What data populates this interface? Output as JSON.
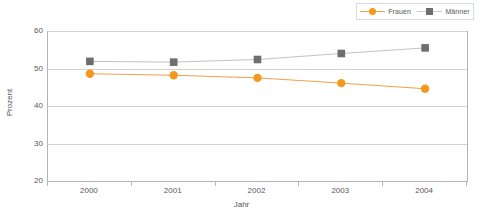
{
  "chart_data": {
    "type": "line",
    "title": "",
    "subtitle": "",
    "xlabel": "Jahr",
    "ylabel": "Prozent",
    "categories": [
      "2000",
      "2001",
      "2002",
      "2003",
      "2004"
    ],
    "x": [
      2000,
      2001,
      2002,
      2003,
      2004
    ],
    "xlim": [
      1999.5,
      2004.5
    ],
    "ylim": [
      20,
      60
    ],
    "y_ticks": [
      20,
      30,
      40,
      50,
      60
    ],
    "grid": "horizontal",
    "legend_position": "top-right",
    "series": [
      {
        "name": "Frauen",
        "color": "#f5981e",
        "line_color": "#f0a04a",
        "marker": "circle",
        "values": [
          48.6,
          48.2,
          47.5,
          46.1,
          44.6
        ]
      },
      {
        "name": "Männer",
        "color": "#6e6e6e",
        "line_color": "#c3c3c3",
        "marker": "square",
        "values": [
          51.9,
          51.7,
          52.4,
          54.0,
          55.5
        ]
      }
    ]
  },
  "legend": {
    "entries": [
      {
        "label": "Frauen"
      },
      {
        "label": "Männer"
      }
    ]
  },
  "axes": {
    "y_title": "Prozent",
    "x_title": "Jahr",
    "y_tick_labels": [
      "60",
      "50",
      "40",
      "30",
      "20"
    ],
    "x_tick_labels": [
      "2000",
      "2001",
      "2002",
      "2003",
      "2004"
    ]
  },
  "colors": {
    "frauen": "#f5981e",
    "frauen_line": "#f0a04a",
    "maenner": "#6e6e6e",
    "maenner_line": "#c3c3c3",
    "gridline": "#d2d2d2",
    "axis": "#b5b5b5",
    "text": "#58585a",
    "background": "#ffffff"
  }
}
